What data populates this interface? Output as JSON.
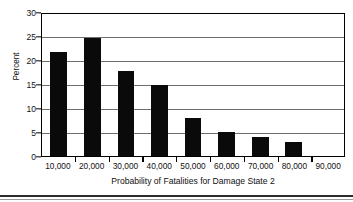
{
  "chart_data": {
    "type": "bar",
    "title": "",
    "xlabel": "Probability of Fatalities for Damage State 2",
    "ylabel": "Percent",
    "categories": [
      "10,000",
      "20,000",
      "30,000",
      "40,000",
      "50,000",
      "60,000",
      "70,000",
      "80,000",
      "90,000"
    ],
    "values": [
      22,
      25,
      18,
      15,
      8,
      5,
      4,
      3,
      0
    ],
    "ylim": [
      0,
      30
    ],
    "ytick_labels": [
      "0",
      "5",
      "10",
      "15",
      "20",
      "25",
      "30"
    ],
    "ytick_values": [
      0,
      5,
      10,
      15,
      20,
      25,
      30
    ],
    "grid": "horizontal",
    "legend": "none",
    "bar_color": "#0a0a0a",
    "gridline_color": "#6f6f6f",
    "axis_color": "#000000",
    "background_color": "#ffffff"
  },
  "axes": {
    "y_title": "Percent",
    "x_title": "Probability of Fatalities for Damage State 2"
  }
}
